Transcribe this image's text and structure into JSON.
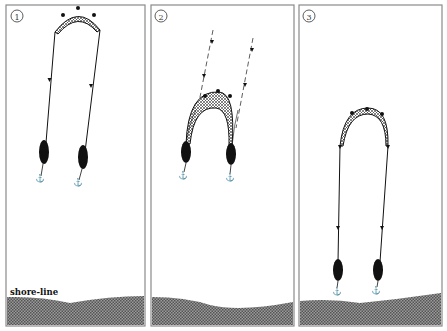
{
  "figure": {
    "colors": {
      "ink": "#111111",
      "frame": "#8a8a8a",
      "background": "#ffffff",
      "shore": "#7a7a7a",
      "net_fill": "#bdbdbd"
    }
  },
  "panels": [
    {
      "number": "1",
      "label": "①",
      "description": "Boats far from shore, net arc at top, ropes drawn as solid lines"
    },
    {
      "number": "2",
      "label": "②",
      "description": "Boats haul net; dashed lines show former rope positions"
    },
    {
      "number": "3",
      "label": "③",
      "description": "Boats near shore, net pulled closer"
    }
  ],
  "shore": {
    "label": "shore-line"
  }
}
